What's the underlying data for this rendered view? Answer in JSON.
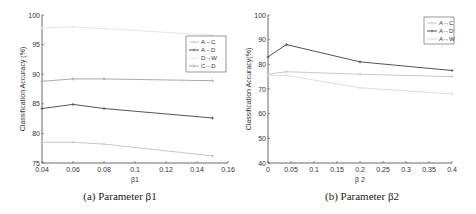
{
  "chart_data": [
    {
      "type": "line",
      "caption": "(a) Parameter β1",
      "xlabel": "β1",
      "ylabel": "Classification Accuracy (%)",
      "xlim": [
        0.04,
        0.16
      ],
      "ylim": [
        75,
        100
      ],
      "xticks": [
        0.04,
        0.06,
        0.08,
        0.1,
        0.12,
        0.14,
        0.16
      ],
      "yticks": [
        75,
        80,
        85,
        90,
        95,
        100
      ],
      "x": [
        0.04,
        0.06,
        0.08,
        0.15
      ],
      "legend_position": "upper right",
      "series": [
        {
          "name": "A→C",
          "color": "#c8c8c8",
          "values": [
            78.5,
            78.5,
            78.2,
            76.2
          ]
        },
        {
          "name": "A→D",
          "color": "#555555",
          "values": [
            84.2,
            84.9,
            84.2,
            82.6
          ]
        },
        {
          "name": "D→W",
          "color": "#e6e6e6",
          "values": [
            97.8,
            98.0,
            97.7,
            96.6
          ]
        },
        {
          "name": "C→D",
          "color": "#aaaaaa",
          "values": [
            88.8,
            89.2,
            89.2,
            88.9
          ]
        }
      ]
    },
    {
      "type": "line",
      "caption": "(b) Parameter β2",
      "xlabel": "β 2",
      "ylabel": "Classification Accuracy(%)",
      "xlim": [
        0,
        0.4
      ],
      "ylim": [
        40,
        100
      ],
      "xticks": [
        0,
        0.05,
        0.1,
        0.15,
        0.2,
        0.25,
        0.3,
        0.35,
        0.4
      ],
      "yticks": [
        40,
        50,
        60,
        70,
        80,
        90,
        100
      ],
      "x": [
        0,
        0.04,
        0.2,
        0.4
      ],
      "legend_position": "upper right",
      "series": [
        {
          "name": "A→C",
          "color": "#c8c8c8",
          "values": [
            76,
            77,
            76,
            75
          ]
        },
        {
          "name": "A→D",
          "color": "#555555",
          "values": [
            83,
            88,
            81,
            77.5
          ]
        },
        {
          "name": "A→W",
          "color": "#dddddd",
          "values": [
            75.5,
            75.5,
            70.5,
            68
          ]
        }
      ]
    }
  ]
}
